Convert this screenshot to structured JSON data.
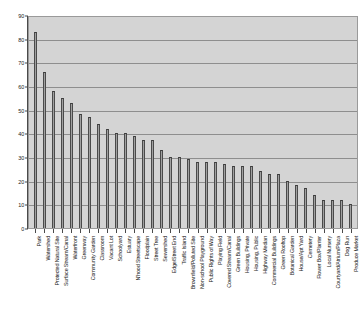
{
  "chart_data": {
    "type": "bar",
    "title": "",
    "subtitle": "",
    "xlabel": "",
    "ylabel": "",
    "ylim": [
      0,
      90
    ],
    "ytick_step": 10,
    "yticks": [
      "0",
      "10",
      "20",
      "30",
      "40",
      "50",
      "60",
      "70",
      "80",
      "90"
    ],
    "grid": true,
    "legend": false,
    "orientation": "vertical",
    "categories": [
      "Park",
      "Watershed",
      "Protected Natural Site",
      "Surface Stream/Canal",
      "Waterfront",
      "Greenway",
      "Community Garden",
      "Classroom",
      "Vacant Lot",
      "Schoolyard",
      "Estuary",
      "N'hood Streetscape",
      "Floodplain",
      "Street Tree",
      "Sewershed",
      "Edge/Street End",
      "Traffic Island",
      "Brownfield/Polluted Site",
      "Non-school Playground",
      "Public Rights of Way",
      "Playing Field",
      "Covered Stream/Canal",
      "Green Buildings",
      "Housing, Private",
      "Housing, Public",
      "Highway Median",
      "Commercial Buildings",
      "Green  Rooftop",
      "Botanical Garden",
      "House/Apt Yard",
      "Cemetery",
      "Flower Box/Planter",
      "Local Nursery",
      "Courtyard/Atrium/Plaza",
      "Dog Run",
      "Produce Market"
    ],
    "values": [
      83,
      66,
      58,
      55,
      53,
      48,
      47,
      44,
      42,
      40,
      40,
      39,
      37,
      37,
      33,
      30,
      30,
      29,
      28,
      28,
      28,
      27,
      26,
      26,
      26,
      24,
      23,
      23,
      20,
      18,
      17,
      14,
      12,
      12,
      12,
      10
    ]
  },
  "style": {
    "plot_background": "#d4d4d4",
    "bar_fill": "#a0a0a0",
    "bar_edge": "#4a4a4a",
    "gridline_color": "#8e8e8e",
    "axis_color": "#4a4a4a",
    "text_color": "#1a1a1a",
    "page_background": "#ffffff"
  }
}
